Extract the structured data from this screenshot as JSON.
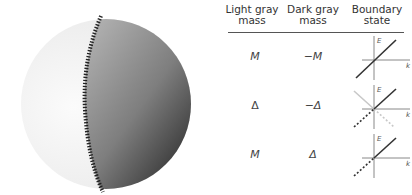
{
  "figure": {
    "sphere": {
      "light_region": "light gray hemisphere (left)",
      "dark_region": "dark gray hemisphere (right)",
      "boundary": "hatched domain wall"
    },
    "table": {
      "headers": [
        "Light gray mass",
        "Dark gray mass",
        "Boundary state"
      ],
      "header_lines": [
        [
          "Light gray",
          "mass"
        ],
        [
          "Dark gray",
          "mass"
        ],
        [
          "Boundary",
          "state"
        ]
      ],
      "rows": [
        {
          "light": "M",
          "dark": "−M",
          "state": "chiral mode (single solid line)"
        },
        {
          "light": "Δ",
          "dark": "−Δ",
          "state": "helical/Majorana pair (solid + dashed, light gray crossing)"
        },
        {
          "light": "M",
          "dark": "Δ",
          "state": "chiral Majorana (solid + dashed)"
        }
      ],
      "axis_labels": {
        "energy": "E",
        "momentum": "k"
      }
    }
  }
}
